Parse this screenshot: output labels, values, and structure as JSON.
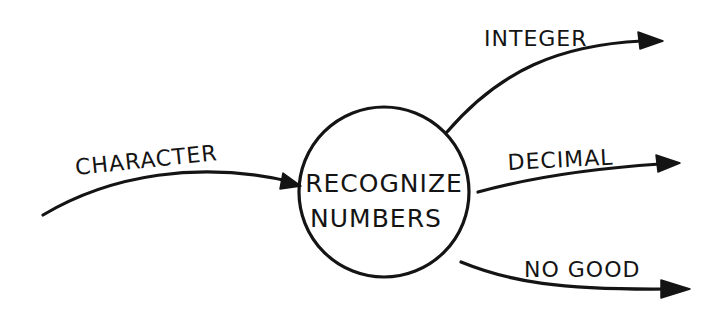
{
  "diagram": {
    "type": "data-flow-diagram",
    "style": "hand-drawn",
    "colors": {
      "ink": "#141414",
      "background": "#ffffff"
    },
    "process": {
      "shape": "circle",
      "label_line1": "RECOGNIZE",
      "label_line2": "NUMBERS"
    },
    "flows": [
      {
        "id": "character",
        "label": "CHARACTER",
        "direction": "input",
        "target": "RECOGNIZE NUMBERS"
      },
      {
        "id": "integer",
        "label": "INTEGER",
        "direction": "output",
        "source": "RECOGNIZE NUMBERS"
      },
      {
        "id": "decimal",
        "label": "DECIMAL",
        "direction": "output",
        "source": "RECOGNIZE NUMBERS"
      },
      {
        "id": "no-good",
        "label": "NO GOOD",
        "direction": "output",
        "source": "RECOGNIZE NUMBERS"
      }
    ]
  }
}
